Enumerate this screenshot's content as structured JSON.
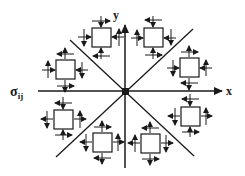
{
  "diagram": {
    "axis_x_label": "x",
    "axis_y_label": "y",
    "stress_label_main": "σ",
    "stress_label_sub": "ij",
    "colors": {
      "line": "#1a1a1a",
      "box_fill": "#ffffff",
      "background": "#ffffff"
    },
    "center": [
      125,
      91
    ],
    "elements": [
      {
        "id": "element-top-left",
        "x": 92,
        "y": 28,
        "size": 19
      },
      {
        "id": "element-top-right",
        "x": 144,
        "y": 28,
        "size": 19
      },
      {
        "id": "element-left-upper",
        "x": 56,
        "y": 60,
        "size": 19
      },
      {
        "id": "element-right-upper",
        "x": 180,
        "y": 58,
        "size": 19
      },
      {
        "id": "element-left-lower",
        "x": 54,
        "y": 110,
        "size": 19
      },
      {
        "id": "element-right-lower",
        "x": 181,
        "y": 107,
        "size": 19
      },
      {
        "id": "element-bottom-left",
        "x": 93,
        "y": 133,
        "size": 19
      },
      {
        "id": "element-bottom-right",
        "x": 141,
        "y": 134,
        "size": 19
      }
    ]
  }
}
